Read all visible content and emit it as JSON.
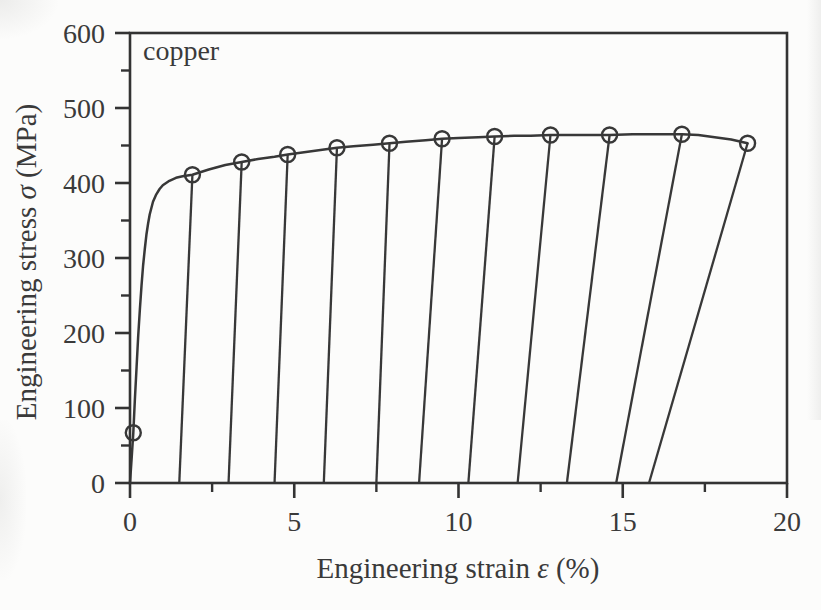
{
  "chart_data": {
    "type": "line",
    "title": "copper",
    "xlabel": "Engineering strain ε (%)",
    "ylabel": "Engineering stress σ (MPa)",
    "xlabel_parts": [
      "Engineering strain ",
      "ε",
      " (%)"
    ],
    "ylabel_parts": [
      "Engineering stress ",
      "σ",
      " (MPa)"
    ],
    "xlim": [
      0,
      20
    ],
    "ylim": [
      0,
      600
    ],
    "grid": false,
    "legend_position": "none",
    "x_major_ticks": [
      0,
      5,
      10,
      15,
      20
    ],
    "x_tick_labels": [
      "0",
      "5",
      "10",
      "15",
      "20"
    ],
    "x_minor_ticks": [
      2.5,
      7.5,
      12.5,
      17.5
    ],
    "y_major_ticks": [
      0,
      100,
      200,
      300,
      400,
      500,
      600
    ],
    "y_tick_labels": [
      "0",
      "100",
      "200",
      "300",
      "400",
      "500",
      "600"
    ],
    "y_minor_ticks": [
      50,
      150,
      250,
      350,
      450,
      550
    ],
    "series": [
      {
        "name": "loading-backbone-curve",
        "type": "line",
        "points": [
          [
            0,
            0
          ],
          [
            0.05,
            32
          ],
          [
            0.1,
            67
          ],
          [
            0.15,
            112
          ],
          [
            0.2,
            155
          ],
          [
            0.25,
            196
          ],
          [
            0.3,
            232
          ],
          [
            0.35,
            263
          ],
          [
            0.4,
            290
          ],
          [
            0.45,
            312
          ],
          [
            0.5,
            331
          ],
          [
            0.55,
            346
          ],
          [
            0.6,
            358
          ],
          [
            0.7,
            375
          ],
          [
            0.8,
            385
          ],
          [
            0.9,
            392
          ],
          [
            1.0,
            397
          ],
          [
            1.2,
            403
          ],
          [
            1.4,
            407
          ],
          [
            1.6,
            409
          ],
          [
            1.9,
            411
          ],
          [
            2.4,
            418
          ],
          [
            2.9,
            424
          ],
          [
            3.4,
            428
          ],
          [
            3.9,
            432
          ],
          [
            4.4,
            435
          ],
          [
            4.8,
            438
          ],
          [
            5.3,
            441
          ],
          [
            5.8,
            444
          ],
          [
            6.3,
            447
          ],
          [
            6.8,
            449
          ],
          [
            7.4,
            451
          ],
          [
            7.9,
            453
          ],
          [
            8.4,
            455
          ],
          [
            9.0,
            457
          ],
          [
            9.5,
            459
          ],
          [
            10.0,
            460
          ],
          [
            10.6,
            461
          ],
          [
            11.1,
            462
          ],
          [
            11.7,
            463
          ],
          [
            12.2,
            463
          ],
          [
            12.8,
            464
          ],
          [
            13.4,
            464
          ],
          [
            14.0,
            464
          ],
          [
            14.6,
            464
          ],
          [
            15.3,
            465
          ],
          [
            16.0,
            465
          ],
          [
            16.8,
            465
          ],
          [
            17.3,
            464
          ],
          [
            17.8,
            461
          ],
          [
            18.3,
            458
          ],
          [
            18.8,
            453
          ]
        ]
      },
      {
        "name": "unloading-reloading-lines",
        "type": "segments",
        "segments": [
          [
            [
              1.9,
              411
            ],
            [
              1.5,
              0
            ]
          ],
          [
            [
              3.4,
              428
            ],
            [
              3.0,
              0
            ]
          ],
          [
            [
              4.8,
              438
            ],
            [
              4.4,
              0
            ]
          ],
          [
            [
              6.3,
              447
            ],
            [
              5.9,
              0
            ]
          ],
          [
            [
              7.9,
              453
            ],
            [
              7.5,
              0
            ]
          ],
          [
            [
              9.5,
              459
            ],
            [
              8.8,
              0
            ]
          ],
          [
            [
              11.1,
              462
            ],
            [
              10.3,
              0
            ]
          ],
          [
            [
              12.8,
              464
            ],
            [
              11.8,
              0
            ]
          ],
          [
            [
              14.6,
              464
            ],
            [
              13.3,
              0
            ]
          ],
          [
            [
              16.8,
              465
            ],
            [
              14.8,
              0
            ]
          ],
          [
            [
              18.8,
              453
            ],
            [
              15.8,
              0
            ]
          ]
        ]
      },
      {
        "name": "cycle-start-markers",
        "type": "scatter",
        "marker": "open-circle",
        "points": [
          [
            0.1,
            67
          ],
          [
            1.9,
            411
          ],
          [
            3.4,
            428
          ],
          [
            4.8,
            438
          ],
          [
            6.3,
            447
          ],
          [
            7.9,
            453
          ],
          [
            9.5,
            459
          ],
          [
            11.1,
            462
          ],
          [
            12.8,
            464
          ],
          [
            14.6,
            464
          ],
          [
            16.8,
            465
          ],
          [
            18.8,
            453
          ]
        ]
      }
    ],
    "colors": {
      "line": "#383838",
      "axis": "#333333",
      "text": "#3a3a3a",
      "background": "#fcfcfb"
    }
  }
}
